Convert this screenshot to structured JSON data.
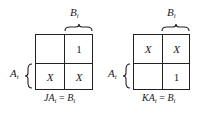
{
  "maps": [
    {
      "id": "J",
      "column_label": "B",
      "column_label_sub": "i",
      "row_label": "A",
      "row_label_sub": "i",
      "cells": {
        "r0c0": "",
        "r0c1": "1",
        "r1c0": "X",
        "r1c1": "X"
      },
      "equation": {
        "lhs": "JA",
        "lhs_sub": "i",
        "eq": " = ",
        "rhs": "B",
        "rhs_sub": "i"
      }
    },
    {
      "id": "K",
      "column_label": "B",
      "column_label_sub": "i",
      "row_label": "A",
      "row_label_sub": "i",
      "cells": {
        "r0c0": "X",
        "r0c1": "X",
        "r1c0": "",
        "r1c1": "1"
      },
      "equation": {
        "lhs": "KA",
        "lhs_sub": "i",
        "eq": " = ",
        "rhs": "B",
        "rhs_sub": "i"
      }
    }
  ]
}
